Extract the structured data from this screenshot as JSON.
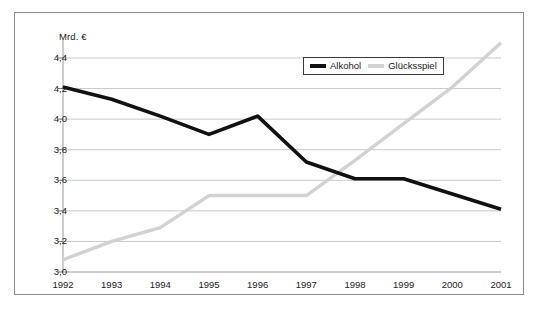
{
  "chart_data": {
    "type": "line",
    "title": "",
    "subtitle": "",
    "xlabel": "",
    "ylabel": "Mrd. €",
    "unit_label": "Mrd. €",
    "categories": [
      "1992",
      "1993",
      "1994",
      "1995",
      "1996",
      "1997",
      "1998",
      "1999",
      "2000",
      "2001"
    ],
    "x": [
      1992,
      1993,
      1994,
      1995,
      1996,
      1997,
      1998,
      1999,
      2000,
      2001
    ],
    "series": [
      {
        "name": "Alkohol",
        "color": "#111111",
        "values": [
          4.21,
          4.13,
          4.02,
          3.9,
          4.02,
          3.72,
          3.61,
          3.61,
          3.51,
          3.41
        ]
      },
      {
        "name": "Glücksspiel",
        "color": "#d2d2d2",
        "values": [
          3.08,
          3.2,
          3.29,
          3.5,
          3.5,
          3.5,
          3.73,
          3.97,
          4.21,
          4.5
        ]
      }
    ],
    "ylim": [
      3.0,
      4.4
    ],
    "ytick_labels": [
      "3,0",
      "3,2",
      "3,4",
      "3,6",
      "3,8",
      "4,0",
      "4,2",
      "4,4"
    ],
    "ytick_values": [
      3.0,
      3.2,
      3.4,
      3.6,
      3.8,
      4.0,
      4.2,
      4.4
    ],
    "grid": true,
    "grid_axis": "y",
    "legend_position": "top-right"
  },
  "legend": {
    "entries": [
      {
        "label": "Alkohol",
        "color": "#111111"
      },
      {
        "label": "Glücksspiel",
        "color": "#d2d2d2"
      }
    ]
  },
  "caption": {
    "text": ""
  }
}
